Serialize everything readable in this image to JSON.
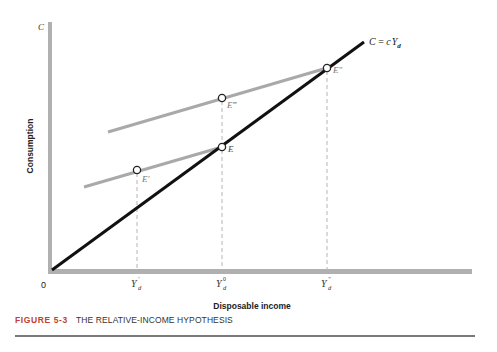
{
  "figure": {
    "number_label": "FIGURE 5-3",
    "title": "THE RELATIVE-INCOME HYPOTHESIS"
  },
  "axes": {
    "y_axis_symbol": "C",
    "y_axis_label": "Consumption",
    "x_axis_label": "Disposable income",
    "origin_label": "0"
  },
  "lines": {
    "long_run": {
      "label_C": "C",
      "label_eq": " = ",
      "label_c": "c",
      "label_Y": "Y",
      "label_sub": "d",
      "color": "#111111"
    },
    "short_run_color": "#a9a9a9"
  },
  "points": {
    "E_prime": "E′",
    "E": "E",
    "E_double": "E″",
    "E_triple": "E‴"
  },
  "ticks": [
    {
      "base": "Y",
      "sub": "d",
      "sup": "′"
    },
    {
      "base": "Y",
      "sub": "d",
      "sup": "0"
    },
    {
      "base": "Y",
      "sub": "d",
      "sup": "″"
    }
  ],
  "colors": {
    "axis": "#b0b0b0",
    "dashed": "#b5b5b5",
    "figure_label": "#c13f2c"
  }
}
